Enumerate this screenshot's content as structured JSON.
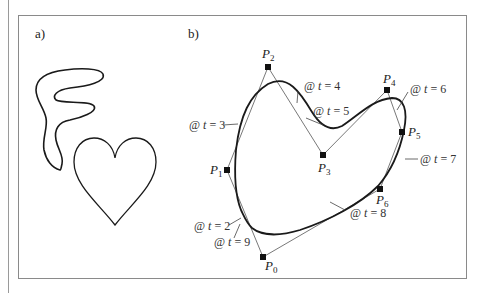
{
  "panels": {
    "a": {
      "label": "a)"
    },
    "b": {
      "label": "b)"
    }
  },
  "shapes_a": [
    "freeform-blob",
    "heart"
  ],
  "control_points": [
    {
      "name": "P",
      "sub": "0",
      "x": 263,
      "y": 257
    },
    {
      "name": "P",
      "sub": "1",
      "x": 227,
      "y": 170
    },
    {
      "name": "P",
      "sub": "2",
      "x": 268,
      "y": 67
    },
    {
      "name": "P",
      "sub": "3",
      "x": 323,
      "y": 155
    },
    {
      "name": "P",
      "sub": "4",
      "x": 387,
      "y": 90
    },
    {
      "name": "P",
      "sub": "5",
      "x": 402,
      "y": 132
    },
    {
      "name": "P",
      "sub": "6",
      "x": 380,
      "y": 189
    }
  ],
  "knot_labels": [
    {
      "text_at": "@ ",
      "var": "t",
      "eq": " = 2",
      "id": "t2"
    },
    {
      "text_at": "@ ",
      "var": "t",
      "eq": " = 3",
      "id": "t3"
    },
    {
      "text_at": "@ ",
      "var": "t",
      "eq": " = 4",
      "id": "t4"
    },
    {
      "text_at": "@ ",
      "var": "t",
      "eq": " = 5",
      "id": "t5"
    },
    {
      "text_at": "@ ",
      "var": "t",
      "eq": " = 6",
      "id": "t6"
    },
    {
      "text_at": "@ ",
      "var": "t",
      "eq": " = 7",
      "id": "t7"
    },
    {
      "text_at": "@ ",
      "var": "t",
      "eq": " = 8",
      "id": "t8"
    },
    {
      "text_at": "@ ",
      "var": "t",
      "eq": " = 9",
      "id": "t9"
    }
  ],
  "colors": {
    "curve": "#1a1a1a",
    "polygon": "#555555",
    "frame": "#8a8a8a"
  }
}
